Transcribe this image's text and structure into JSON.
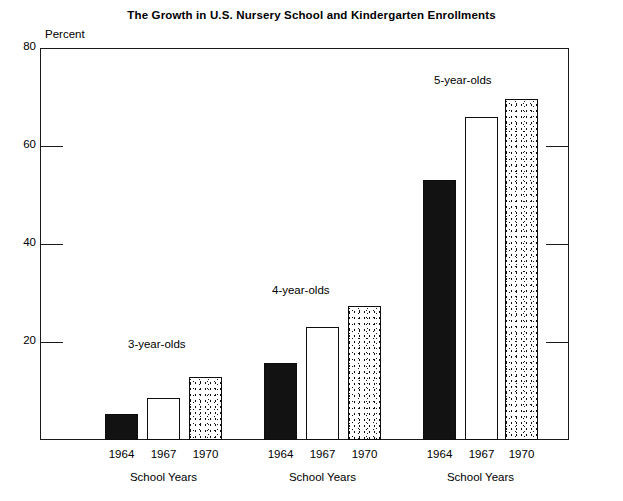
{
  "chart_data": {
    "type": "bar",
    "title": "The Growth in U.S. Nursery School and Kindergarten Enrollments",
    "ylabel": "Percent",
    "xlabel": "School Years",
    "ylim": [
      0,
      80
    ],
    "yticks": [
      80,
      60,
      40,
      20
    ],
    "ytick_labels": [
      "80",
      "60",
      "40",
      "20"
    ],
    "grid": false,
    "legend": "none",
    "categories": [
      "1964",
      "1967",
      "1970"
    ],
    "groups": [
      {
        "name": "3-year-olds",
        "axis_caption": "School Years",
        "bars": [
          {
            "category": "1964",
            "value": 5.3,
            "style": "solid"
          },
          {
            "category": "1967",
            "value": 8.5,
            "style": "open"
          },
          {
            "category": "1970",
            "value": 12.8,
            "style": "stipple"
          }
        ]
      },
      {
        "name": "4-year-olds",
        "axis_caption": "School Years",
        "bars": [
          {
            "category": "1964",
            "value": 15.7,
            "style": "solid"
          },
          {
            "category": "1967",
            "value": 23.0,
            "style": "open"
          },
          {
            "category": "1970",
            "value": 27.3,
            "style": "stipple"
          }
        ]
      },
      {
        "name": "5-year-olds",
        "axis_caption": "School Years",
        "bars": [
          {
            "category": "1964",
            "value": 53.0,
            "style": "solid"
          },
          {
            "category": "1967",
            "value": 66.0,
            "style": "open"
          },
          {
            "category": "1970",
            "value": 69.5,
            "style": "stipple"
          }
        ]
      }
    ]
  },
  "title": {
    "text": "The Growth in U.S. Nursery School and Kindergarten Enrollments"
  },
  "yaxis": {
    "caption": "Percent",
    "ticks": [
      {
        "label": "80",
        "value": 80
      },
      {
        "label": "60",
        "value": 60
      },
      {
        "label": "40",
        "value": 40
      },
      {
        "label": "20",
        "value": 20
      }
    ]
  },
  "groups": [
    {
      "caption": "3-year-olds",
      "axis_caption": "School Years",
      "years": [
        "1964",
        "1967",
        "1970"
      ]
    },
    {
      "caption": "4-year-olds",
      "axis_caption": "School Years",
      "years": [
        "1964",
        "1967",
        "1970"
      ]
    },
    {
      "caption": "5-year-olds",
      "axis_caption": "School Years",
      "years": [
        "1964",
        "1967",
        "1970"
      ]
    }
  ]
}
